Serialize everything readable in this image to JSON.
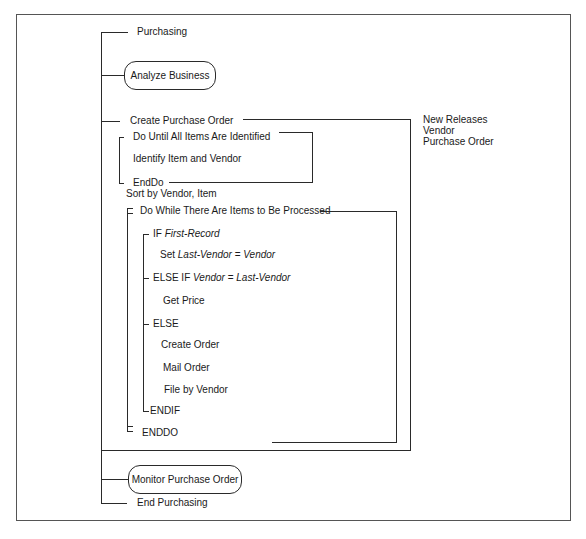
{
  "diagram": {
    "type": "Warnier-Orr / action diagram",
    "title": "Purchasing",
    "nodes": {
      "start": "Purchasing",
      "analyze_business": "Analyze Business",
      "create_purchase_order": "Create Purchase Order",
      "do_until": "Do Until All Items Are Identified",
      "identify_item": "Identify Item and Vendor",
      "enddo_inner": "EndDo",
      "sort": "Sort by Vendor, Item",
      "do_while": "Do While There Are Items to Be Processed",
      "if_kw": "IF",
      "if_cond": "First-Record",
      "set_kw": "Set",
      "set_lhs": "Last-Vendor",
      "set_eq": "=",
      "set_rhs": "Vendor",
      "elseif_kw": "ELSE IF",
      "elseif_lhs": "Vendor",
      "elseif_eq": "=",
      "elseif_rhs": "Last-Vendor",
      "get_price": "Get Price",
      "else_kw": "ELSE",
      "create_order": "Create Order",
      "mail_order": "Mail Order",
      "file_by_vendor": "File by Vendor",
      "endif": "ENDIF",
      "enddo_outer": "ENDDO",
      "monitor_po": "Monitor Purchase Order",
      "end": "End Purchasing"
    },
    "data_flows": [
      "New Releases",
      "Vendor",
      "Purchase Order"
    ]
  }
}
